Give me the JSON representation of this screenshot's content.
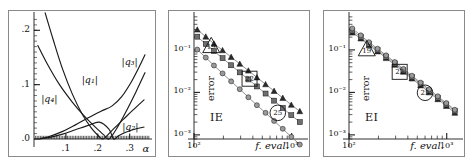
{
  "figure": {
    "panel_count": 3,
    "background": "#ffffff",
    "frame_color": "#8a8a8a",
    "ink_color": "#1a1a1a"
  },
  "chart_data": [
    {
      "id": "panel-a",
      "type": "line",
      "title": "",
      "xlabel": "α",
      "ylabel": "",
      "xlim": [
        0.0,
        0.37
      ],
      "ylim": [
        0.0,
        0.23
      ],
      "xticks": [
        0.1,
        0.2,
        0.3
      ],
      "xticklabels": [
        ".1",
        ".2",
        ".3"
      ],
      "yticks": [
        0.0,
        0.1,
        0.2
      ],
      "yticklabels": [
        ".0",
        ".1",
        ".2"
      ],
      "grid": false,
      "legend": "inline-curve-labels",
      "minor_ticks": true,
      "series": [
        {
          "name": "|q1|",
          "label": "|q₁|",
          "label_x": 0.175,
          "label_y": 0.118,
          "x": [
            0.035,
            0.06,
            0.09,
            0.12,
            0.15,
            0.18,
            0.205,
            0.215,
            0.225,
            0.25,
            0.28,
            0.31,
            0.345
          ],
          "y": [
            0.232,
            0.183,
            0.128,
            0.083,
            0.047,
            0.02,
            0.004,
            0.0,
            0.004,
            0.019,
            0.036,
            0.053,
            0.072
          ]
        },
        {
          "name": "|q2|",
          "label": "|q₂|",
          "label_x": 0.302,
          "label_y": 0.032,
          "x": [
            0.02,
            0.05,
            0.09,
            0.13,
            0.17,
            0.205,
            0.235,
            0.25,
            0.265,
            0.29,
            0.315,
            0.345
          ],
          "y": [
            0.0005,
            0.003,
            0.009,
            0.017,
            0.025,
            0.031,
            0.018,
            0.0,
            0.006,
            0.013,
            0.018,
            0.022
          ]
        },
        {
          "name": "|q3|",
          "label": "|q₃|",
          "label_x": 0.3,
          "label_y": 0.15,
          "x": [
            0.02,
            0.05,
            0.09,
            0.13,
            0.17,
            0.21,
            0.245,
            0.275,
            0.305,
            0.33,
            0.348
          ],
          "y": [
            0.0008,
            0.005,
            0.014,
            0.026,
            0.039,
            0.051,
            0.061,
            0.078,
            0.105,
            0.133,
            0.155
          ]
        },
        {
          "name": "|q4|",
          "label": "|q₄|",
          "label_x": 0.048,
          "label_y": 0.082,
          "x": [
            0.012,
            0.04,
            0.08,
            0.12,
            0.155,
            0.185,
            0.205,
            0.218,
            0.235,
            0.26,
            0.29,
            0.32,
            0.348
          ],
          "y": [
            0.172,
            0.14,
            0.1,
            0.068,
            0.044,
            0.026,
            0.015,
            0.008,
            0.0,
            0.02,
            0.052,
            0.087,
            0.122
          ]
        }
      ]
    },
    {
      "id": "panel-b",
      "type": "scatter-line",
      "panel_tag": "IE",
      "title": "",
      "xlabel": "f. eval.",
      "ylabel": "error",
      "xscale": "log",
      "yscale": "log",
      "xlim": [
        100,
        1400
      ],
      "ylim": [
        0.0008,
        0.7
      ],
      "xticks": [
        100,
        1000
      ],
      "xticklabels": [
        "10²",
        "10³"
      ],
      "yticks": [
        0.1,
        0.01,
        0.001
      ],
      "yticklabels": [
        "10⁻¹",
        "10⁻²",
        "10⁻³"
      ],
      "grid": false,
      "minor_ticks": true,
      "annotations": [
        {
          "shape": "triangle",
          "text": "19",
          "x": 150,
          "y": 0.125
        },
        {
          "shape": "square",
          "text": "22",
          "x": 370,
          "y": 0.021
        },
        {
          "shape": "circle",
          "text": "25",
          "x": 720,
          "y": 0.0033
        }
      ],
      "series": [
        {
          "name": "order-19",
          "marker": "triangle",
          "marker_fill": "#2b2b2b",
          "x": [
            108,
            132,
            160,
            196,
            240,
            294,
            360,
            440,
            540,
            660,
            810,
            990,
            1210
          ],
          "y": [
            0.3,
            0.205,
            0.14,
            0.098,
            0.068,
            0.047,
            0.0325,
            0.0225,
            0.0155,
            0.0108,
            0.0074,
            0.0051,
            0.0036
          ]
        },
        {
          "name": "order-22",
          "marker": "square",
          "marker_fill": "#6e6e6e",
          "x": [
            108,
            132,
            160,
            196,
            240,
            294,
            360,
            440,
            540,
            660,
            810,
            990,
            1210
          ],
          "y": [
            0.205,
            0.138,
            0.094,
            0.064,
            0.0435,
            0.0296,
            0.0202,
            0.0138,
            0.0094,
            0.0064,
            0.0043,
            0.0029,
            0.002
          ]
        },
        {
          "name": "order-25",
          "marker": "circle",
          "marker_fill": "#9a9a9a",
          "x": [
            108,
            132,
            160,
            196,
            240,
            294,
            360,
            440,
            540,
            660,
            810,
            990,
            1210
          ],
          "y": [
            0.102,
            0.066,
            0.043,
            0.028,
            0.0182,
            0.0119,
            0.0077,
            0.005,
            0.0033,
            0.00213,
            0.00139,
            0.0009,
            0.00059
          ]
        }
      ]
    },
    {
      "id": "panel-c",
      "type": "scatter-line",
      "panel_tag": "EI",
      "title": "",
      "xlabel": "f. eval.",
      "ylabel": "error",
      "xscale": "log",
      "yscale": "log",
      "xlim": [
        100,
        1400
      ],
      "ylim": [
        0.0008,
        0.7
      ],
      "xticks": [
        100,
        1000
      ],
      "xticklabels": [
        "10²",
        "10³"
      ],
      "yticks": [
        0.1,
        0.01,
        0.001
      ],
      "yticklabels": [
        "10⁻¹",
        "10⁻²",
        "10⁻³"
      ],
      "grid": false,
      "minor_ticks": true,
      "annotations": [
        {
          "shape": "triangle",
          "text": "19",
          "x": 152,
          "y": 0.105
        },
        {
          "shape": "square",
          "text": "22",
          "x": 330,
          "y": 0.0305
        },
        {
          "shape": "circle",
          "text": "25",
          "x": 600,
          "y": 0.0098
        }
      ],
      "series": [
        {
          "name": "order-19",
          "marker": "triangle",
          "marker_fill": "#2b2b2b",
          "x": [
            108,
            132,
            160,
            196,
            240,
            294,
            360,
            440,
            540,
            660,
            810,
            990,
            1210
          ],
          "y": [
            0.255,
            0.185,
            0.128,
            0.092,
            0.064,
            0.0445,
            0.0305,
            0.0212,
            0.0146,
            0.01,
            0.0069,
            0.0048,
            0.0033
          ]
        },
        {
          "name": "order-22",
          "marker": "square",
          "marker_fill": "#6e6e6e",
          "x": [
            108,
            132,
            160,
            196,
            240,
            294,
            360,
            440,
            540,
            660,
            810,
            990,
            1210
          ],
          "y": [
            0.285,
            0.2,
            0.139,
            0.099,
            0.069,
            0.048,
            0.033,
            0.0229,
            0.0158,
            0.0109,
            0.0075,
            0.0052,
            0.0036
          ]
        },
        {
          "name": "order-25",
          "marker": "circle",
          "marker_fill": "#9a9a9a",
          "x": [
            108,
            132,
            160,
            196,
            240,
            294,
            360,
            440,
            540,
            660,
            810,
            990,
            1210
          ],
          "y": [
            0.32,
            0.22,
            0.152,
            0.107,
            0.0745,
            0.0518,
            0.0357,
            0.0247,
            0.017,
            0.0118,
            0.0081,
            0.0056,
            0.0039
          ]
        }
      ]
    }
  ]
}
